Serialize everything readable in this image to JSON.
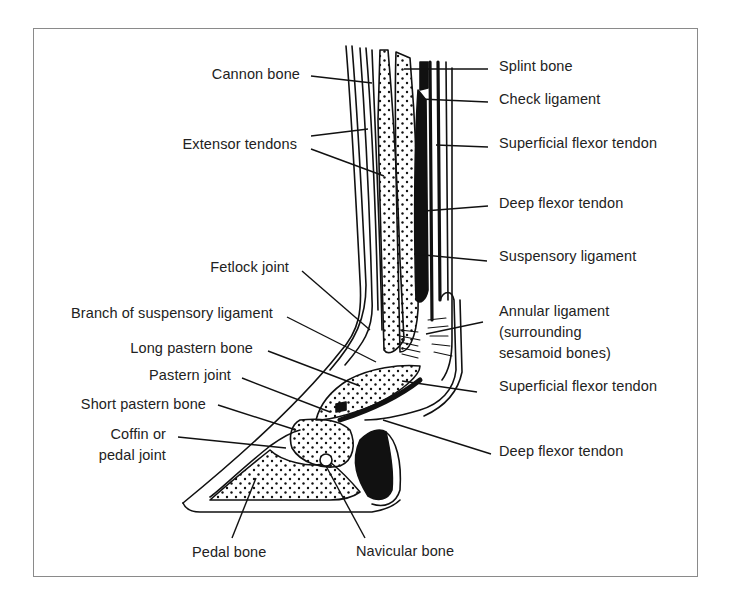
{
  "figure": {
    "labels_left": [
      {
        "id": "cannon-bone",
        "text": "Cannon bone"
      },
      {
        "id": "extensor-tendons",
        "text": "Extensor tendons"
      },
      {
        "id": "fetlock-joint",
        "text": "Fetlock joint"
      },
      {
        "id": "branch-suspensory-ligament",
        "text": "Branch of suspensory ligament"
      },
      {
        "id": "long-pastern-bone",
        "text": "Long pastern bone"
      },
      {
        "id": "pastern-joint",
        "text": "Pastern joint"
      },
      {
        "id": "short-pastern-bone",
        "text": "Short pastern bone"
      },
      {
        "id": "coffin-joint",
        "lines": [
          "Coffin or",
          "pedal joint"
        ]
      }
    ],
    "labels_right": [
      {
        "id": "splint-bone",
        "text": "Splint bone"
      },
      {
        "id": "check-ligament",
        "text": "Check ligament"
      },
      {
        "id": "superficial-flexor-tendon-upper",
        "text": "Superficial flexor tendon"
      },
      {
        "id": "deep-flexor-tendon-upper",
        "text": "Deep flexor tendon"
      },
      {
        "id": "suspensory-ligament",
        "text": "Suspensory ligament"
      },
      {
        "id": "annular-ligament",
        "lines": [
          "Annular ligament",
          "(surrounding",
          "sesamoid bones)"
        ]
      },
      {
        "id": "superficial-flexor-tendon-lower",
        "text": "Superficial flexor tendon"
      },
      {
        "id": "deep-flexor-tendon-lower",
        "text": "Deep flexor tendon"
      }
    ],
    "labels_bottom": [
      {
        "id": "pedal-bone",
        "text": "Pedal bone"
      },
      {
        "id": "navicular-bone",
        "text": "Navicular bone"
      }
    ],
    "colors": {
      "ink": "#111111",
      "frame": "#8a8a8a",
      "text": "#222222",
      "background": "#ffffff"
    }
  }
}
